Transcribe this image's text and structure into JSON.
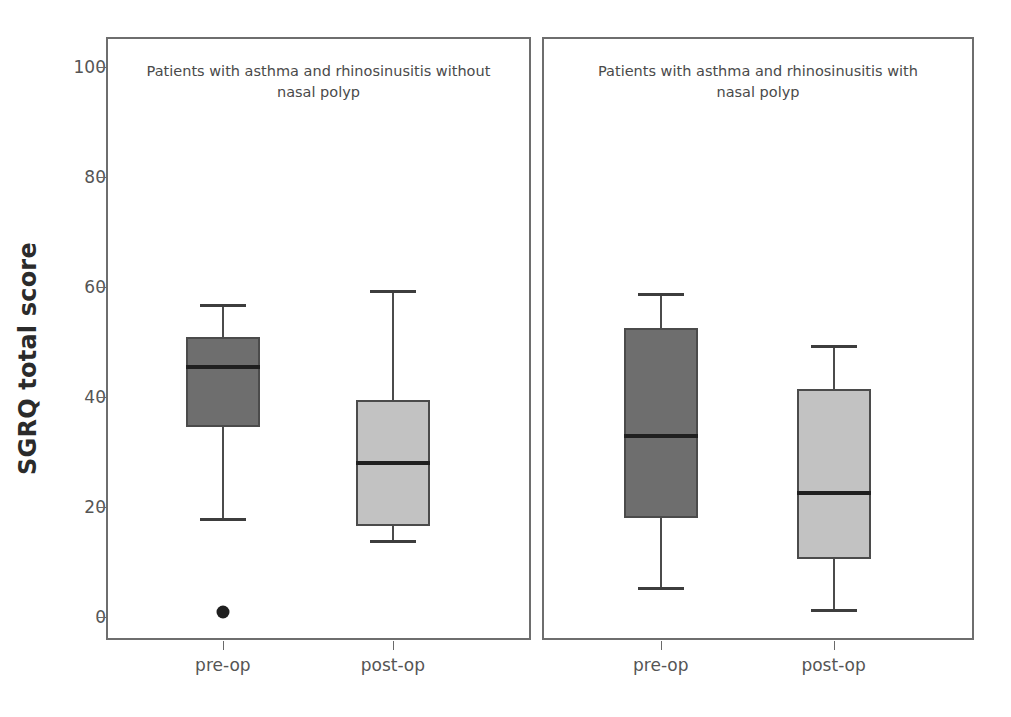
{
  "chart_data": {
    "type": "box",
    "title": "",
    "ylabel": "SGRQ total score",
    "xlabel": "",
    "ylim": [
      0,
      105
    ],
    "yticks": [
      0,
      20,
      40,
      60,
      80,
      100
    ],
    "ytick_labels": [
      "0",
      "20",
      "40",
      "60",
      "80",
      "100"
    ],
    "grid": false,
    "legend": "none",
    "panels": [
      {
        "title": "Patients with asthma and rhinosinusitis without nasal polyp",
        "categories": [
          "pre-op",
          "post-op"
        ],
        "boxes": [
          {
            "label": "pre-op",
            "color": "#6e6e6e",
            "whisker_low": 18,
            "q1": 34.5,
            "median": 45.5,
            "q3": 51,
            "whisker_high": 57,
            "outliers": [
              1
            ]
          },
          {
            "label": "post-op",
            "color": "#c2c2c2",
            "whisker_low": 14,
            "q1": 16.5,
            "median": 28,
            "q3": 39.5,
            "whisker_high": 59.5,
            "outliers": []
          }
        ]
      },
      {
        "title": "Patients with asthma and rhinosinusitis with nasal polyp",
        "categories": [
          "pre-op",
          "post-op"
        ],
        "boxes": [
          {
            "label": "pre-op",
            "color": "#6e6e6e",
            "whisker_low": 5.5,
            "q1": 18,
            "median": 33,
            "q3": 52.5,
            "whisker_high": 59,
            "outliers": []
          },
          {
            "label": "post-op",
            "color": "#c2c2c2",
            "whisker_low": 1.5,
            "q1": 10.5,
            "median": 22.5,
            "q3": 41.5,
            "whisker_high": 49.5,
            "outliers": []
          }
        ]
      }
    ],
    "colors": {
      "dark_box": "#6e6e6e",
      "light_box": "#c2c2c2",
      "frame": "#6e6e6e",
      "median_line": "#1f1f1f",
      "text": "#4a4a4a"
    }
  }
}
